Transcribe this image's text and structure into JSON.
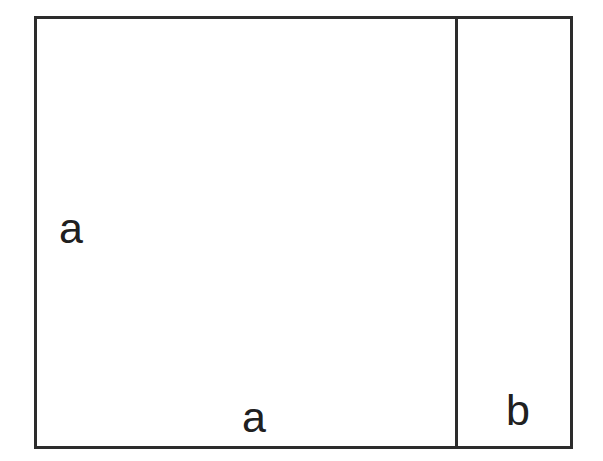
{
  "figure": {
    "type": "geometric-diagram",
    "background_color": "#ffffff",
    "stroke_color": "#2c2c2c",
    "text_color": "#202020",
    "labels": {
      "left_side": "a",
      "bottom_side": "a",
      "right_strip": "b"
    },
    "regions": [
      {
        "name": "square-a",
        "label": "a",
        "description": "Large square with side length a occupying the left portion"
      },
      {
        "name": "strip-b",
        "label": "b",
        "description": "Narrow vertical strip of width b on the right side"
      }
    ],
    "geometry": {
      "outer_rect": {
        "x": 34,
        "y": 16,
        "width": 539,
        "height": 433
      },
      "divider_x": 455,
      "stroke_width": 3
    }
  }
}
